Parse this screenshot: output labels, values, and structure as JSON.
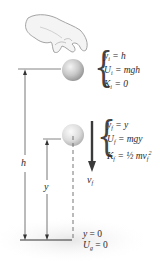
{
  "diagram": {
    "initial_state": {
      "lines": [
        {
          "var": "y",
          "sub": "i",
          "rhs": "= h"
        },
        {
          "var": "U",
          "sub": "i",
          "rhs": "= mgh"
        },
        {
          "var": "K",
          "sub": "i",
          "rhs": "= 0"
        }
      ]
    },
    "final_state": {
      "lines": [
        {
          "var": "y",
          "sub": "f",
          "rhs": "= y"
        },
        {
          "var": "U",
          "sub": "f",
          "rhs": "= mgy"
        },
        {
          "var": "K",
          "sub": "f",
          "rhs": "= ½ mv",
          "sup": "2",
          "rhs_sub": "f"
        }
      ]
    },
    "velocity_label": {
      "var": "v",
      "sub": "f"
    },
    "height_label": "h",
    "y_label": "y",
    "ground": {
      "line1": {
        "var": "y",
        "rhs": "= 0"
      },
      "line2": {
        "var": "U",
        "sub": "g",
        "rhs": "= 0"
      }
    },
    "colors": {
      "ball": "#bdbdbd",
      "ball_highlight": "#f2f2f2",
      "lines": "#555555",
      "arrow": "#3a3a3a",
      "shadow": "#ececec"
    }
  }
}
